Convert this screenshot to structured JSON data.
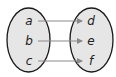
{
  "diagram": {
    "type": "function-mapping",
    "domain": {
      "elements": [
        "a",
        "b",
        "c"
      ]
    },
    "codomain": {
      "elements": [
        "d",
        "e",
        "f"
      ]
    },
    "mappings": [
      {
        "from": "a",
        "to": "d"
      },
      {
        "from": "b",
        "to": "e"
      },
      {
        "from": "c",
        "to": "f"
      }
    ],
    "colors": {
      "ellipse_fill": "#e6e6e6",
      "ellipse_stroke": "#1a1a1a",
      "arrow": "#8a8a8a",
      "text": "#222222"
    }
  }
}
